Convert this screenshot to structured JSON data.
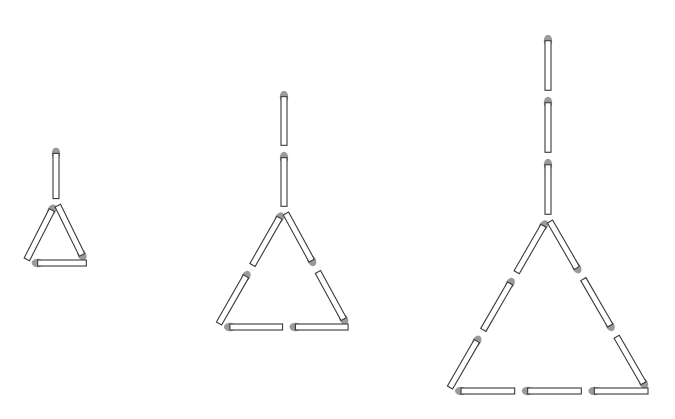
{
  "diagram": {
    "title": "",
    "colors": {
      "background": "#ffffff",
      "stick_fill": "#ffffff",
      "stick_outline": "#3a3a3a",
      "match_head": "#9a9a9a"
    },
    "figures": [
      {
        "id": 1,
        "n": 1,
        "stem_matches": 1,
        "triangle_side_matches": 1,
        "total_matches": 4,
        "stem_x": 56,
        "stem_top": 145,
        "apex_y": 202,
        "bottom_y": 263,
        "left_x": 25,
        "right_x": 86
      },
      {
        "id": 2,
        "n": 2,
        "stem_matches": 2,
        "triangle_side_matches": 2,
        "total_matches": 8,
        "stem_x": 284,
        "stem_top": 88,
        "apex_y": 210,
        "bottom_y": 327,
        "left_x": 217,
        "right_x": 348
      },
      {
        "id": 3,
        "n": 3,
        "stem_matches": 3,
        "triangle_side_matches": 3,
        "total_matches": 12,
        "stem_x": 548,
        "stem_top": 32,
        "apex_y": 218,
        "bottom_y": 391,
        "left_x": 448,
        "right_x": 648
      }
    ]
  }
}
